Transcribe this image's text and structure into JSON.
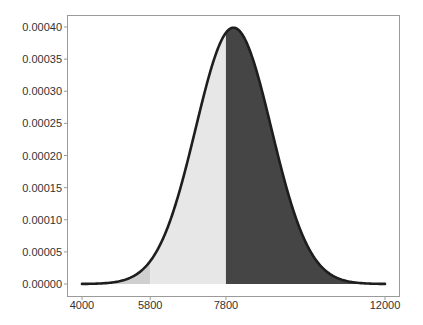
{
  "chart_data": {
    "type": "area",
    "title": "",
    "xlabel": "",
    "ylabel": "",
    "distribution": {
      "kind": "normal",
      "mean": 8000,
      "sd": 1000
    },
    "xlim": [
      4000,
      12000
    ],
    "ylim": [
      0,
      0.0004
    ],
    "grid": false,
    "legend": null,
    "xticks": [
      {
        "value": 4000,
        "label": "4000"
      },
      {
        "value": 5800,
        "label": "5800"
      },
      {
        "value": 7800,
        "label": "7800"
      },
      {
        "value": 12000,
        "label": "12000"
      }
    ],
    "yticks": [
      {
        "value": 0.0,
        "label": "0.00000"
      },
      {
        "value": 5e-05,
        "label": "0.00005"
      },
      {
        "value": 0.0001,
        "label": "0.00010"
      },
      {
        "value": 0.00015,
        "label": "0.00015"
      },
      {
        "value": 0.0002,
        "label": "0.00020"
      },
      {
        "value": 0.00025,
        "label": "0.00025"
      },
      {
        "value": 0.0003,
        "label": "0.00030"
      },
      {
        "value": 0.00035,
        "label": "0.00035"
      },
      {
        "value": 0.0004,
        "label": "0.00040"
      }
    ],
    "x": [
      4000,
      4500,
      5000,
      5500,
      6000,
      6500,
      7000,
      7500,
      8000,
      8500,
      9000,
      9500,
      10000,
      10500,
      11000,
      11500,
      12000
    ],
    "series": [
      {
        "name": "density",
        "values": [
          1.3e-07,
          8.7e-07,
          4.4e-06,
          1.75e-05,
          5.4e-05,
          0.0001295,
          0.000242,
          0.000352,
          0.000399,
          0.000352,
          0.000242,
          0.0001295,
          5.4e-05,
          1.75e-05,
          4.4e-06,
          8.7e-07,
          1.3e-07
        ]
      }
    ],
    "shaded_regions": [
      {
        "from": 4000,
        "to": 5800,
        "color": "#cfcfcf"
      },
      {
        "from": 5800,
        "to": 7800,
        "color": "#e7e7e7"
      },
      {
        "from": 7800,
        "to": 12000,
        "color": "#454545"
      }
    ],
    "curve_color": "#1e1e1e"
  }
}
